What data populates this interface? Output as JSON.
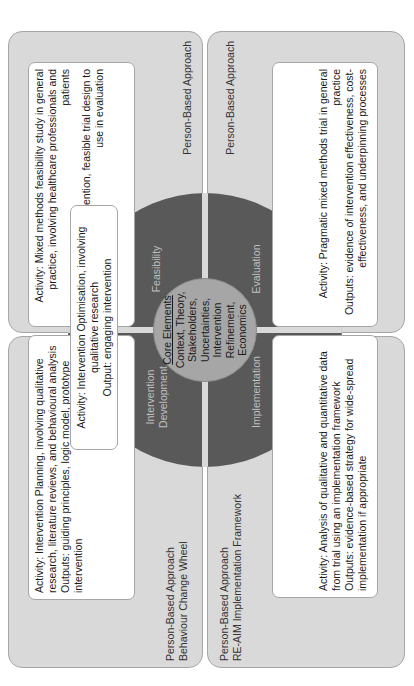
{
  "diagram": {
    "orientation": "rotated-90-counterclockwise",
    "colors": {
      "panel_bg": "#d9d9d9",
      "panel_border": "#a6a6a6",
      "wheel": "#595959",
      "wheel_label": "#bfbfbf",
      "core": "#a6a6a6",
      "box_bg": "#ffffff"
    },
    "core": {
      "title": "Core Elements",
      "items": [
        "Context, Theory,",
        "Stakeholders,",
        "Uncertainties,",
        "Intervention",
        "Refinement,",
        "Economics"
      ]
    },
    "segments": {
      "development": {
        "line1": "Intervention",
        "line2": "Development"
      },
      "feasibility": {
        "label": "Feasibility"
      },
      "implementation": {
        "label": "Implementation"
      },
      "evaluation": {
        "label": "Evaluation"
      }
    },
    "panels": {
      "development": {
        "label_line1": "Person-Based Approach",
        "label_line2": "Behaviour Change Wheel",
        "box": {
          "activity": "Activity: Intervention Planning, involving qualitative research, literature reviews, and behavioural analysis",
          "outputs": "Outputs: guiding principles, logic model, prototype intervention"
        }
      },
      "feasibility": {
        "label": "Person-Based Approach",
        "box": {
          "activity": "Activity: Mixed methods feasibility study in general practice, involving healthcare professionals and patients",
          "outputs": "Outputs: refined intervention, feasible trial design to use in evaluation"
        }
      },
      "implementation": {
        "label_line1": "Person-Based Approach",
        "label_line2": "RE-AIM Implementation Framework",
        "box": {
          "activity": "Activity: Analysis of qualitative and quantitative data from trial using an implementation framework",
          "outputs": "Outputs: evidence-based strategy for wide-spread implementation if appropriate"
        }
      },
      "evaluation": {
        "label": "Person-Based Approach",
        "box": {
          "activity": "Activity: Pragmatic mixed methods trial in general practice",
          "outputs": "Outputs: evidence of intervention effectiveness, cost-effectiveness, and underpinning processes"
        }
      }
    },
    "optimisation_box": {
      "activity": "Activity: Intervention Optimisation, involving qualitative research",
      "output": "Output: engaging intervention"
    }
  }
}
